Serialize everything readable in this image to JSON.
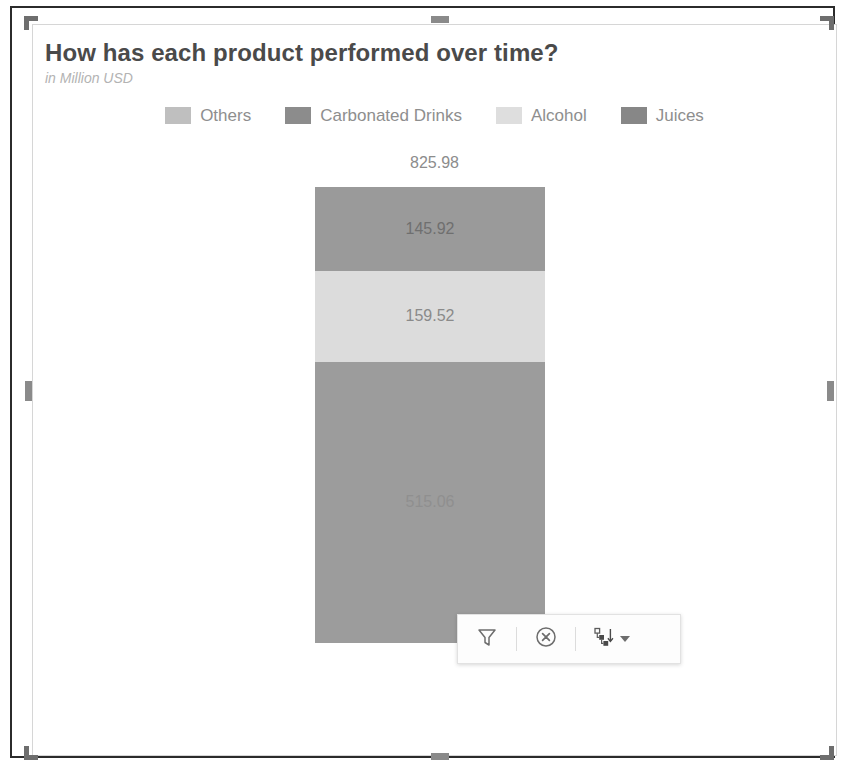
{
  "header": {
    "title": "How has each product performed over time?",
    "subtitle": "in Million USD"
  },
  "toolbar": {
    "filter_icon": "funnel-icon",
    "clear_icon": "circled-x-icon",
    "drill_icon": "drill-hierarchy-icon",
    "drill_caret": "chevron-down-icon"
  },
  "axis": {
    "letter": "A",
    "value_label": "(all)"
  },
  "chart_data": {
    "type": "bar",
    "title": "How has each product performed over time?",
    "subtitle": "in Million USD",
    "xlabel": "",
    "ylabel": "",
    "categories": [
      "(all)"
    ],
    "stacked": true,
    "total_label": "825.98",
    "total_value": 825.98,
    "legend_position": "top",
    "grid": false,
    "legend": [
      {
        "name": "Others",
        "color": "#bfbfbf"
      },
      {
        "name": "Carbonated Drinks",
        "color": "#8c8c8c"
      },
      {
        "name": "Alcohol",
        "color": "#dedede"
      },
      {
        "name": "Juices",
        "color": "#878787"
      }
    ],
    "series": [
      {
        "name": "Others",
        "values": [
          145.92
        ],
        "label": "145.92",
        "color": "#9a9a9a",
        "text_color": "#6f6f6f",
        "height_px": 84
      },
      {
        "name": "Alcohol",
        "values": [
          159.52
        ],
        "label": "159.52",
        "color": "#dcdcdc",
        "text_color": "#8a8a8a",
        "height_px": 91
      },
      {
        "name": "Carbonated Drinks",
        "values": [
          515.06
        ],
        "label": "515.06",
        "color": "#9c9c9c",
        "text_color": "#8f8f8f",
        "height_px": 281
      }
    ]
  }
}
